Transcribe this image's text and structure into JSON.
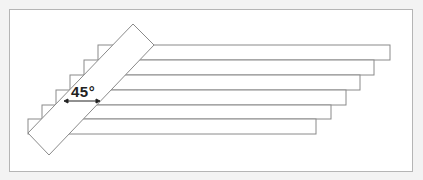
{
  "diagram": {
    "angle_label": "45°",
    "stroke_color": "#8a8a8a",
    "background": "#ffffff",
    "boards": [
      {
        "top": 45,
        "bottom": 60,
        "left": 98,
        "right": 390
      },
      {
        "top": 60,
        "bottom": 75,
        "left": 84,
        "right": 374
      },
      {
        "top": 75,
        "bottom": 90,
        "left": 70,
        "right": 360
      },
      {
        "top": 90,
        "bottom": 105,
        "left": 56,
        "right": 346
      },
      {
        "top": 105,
        "bottom": 119,
        "left": 42,
        "right": 331
      },
      {
        "top": 119,
        "bottom": 134,
        "left": 28,
        "right": 316
      }
    ]
  }
}
